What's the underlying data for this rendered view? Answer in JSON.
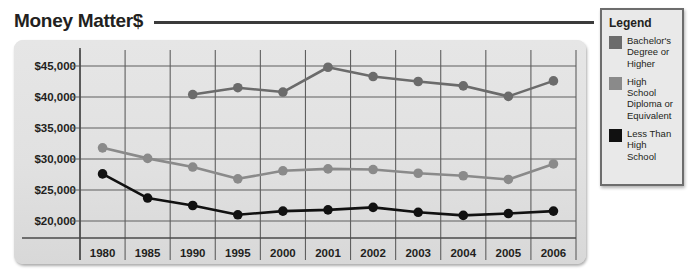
{
  "title": "Money Matter$",
  "legend": {
    "heading": "Legend",
    "items": [
      {
        "label": "Bachelor's Degree or Higher",
        "color": "#6b6b6b"
      },
      {
        "label": "High School Diploma or Equivalent",
        "color": "#8a8a8a"
      },
      {
        "label": "Less Than High School",
        "color": "#111111"
      }
    ]
  },
  "chart_data": {
    "type": "line",
    "title": "Money Matter$",
    "xlabel": "",
    "ylabel": "",
    "ylim": [
      20000,
      45000
    ],
    "ytick_values": [
      45000,
      40000,
      35000,
      30000,
      25000,
      20000
    ],
    "ytick_labels": [
      "$45,000",
      "$40,000",
      "$35,000",
      "$30,000",
      "$25,000",
      "$20,000"
    ],
    "grid": true,
    "legend_position": "right-outside",
    "categories": [
      "1980",
      "1985",
      "1990",
      "1995",
      "2000",
      "2001",
      "2002",
      "2003",
      "2004",
      "2005",
      "2006"
    ],
    "series": [
      {
        "name": "Bachelor's Degree or Higher",
        "color": "#6b6b6b",
        "values": [
          null,
          null,
          40400,
          41500,
          40800,
          44800,
          43300,
          42500,
          41800,
          40100,
          42600
        ]
      },
      {
        "name": "High School Diploma or Equivalent",
        "color": "#8a8a8a",
        "values": [
          31800,
          30100,
          28700,
          26800,
          28100,
          28400,
          28300,
          27700,
          27300,
          26700,
          29200
        ]
      },
      {
        "name": "Less Than High School",
        "color": "#111111",
        "values": [
          27600,
          23700,
          22500,
          21000,
          21600,
          21800,
          22200,
          21400,
          20900,
          21200,
          21600
        ]
      }
    ]
  }
}
